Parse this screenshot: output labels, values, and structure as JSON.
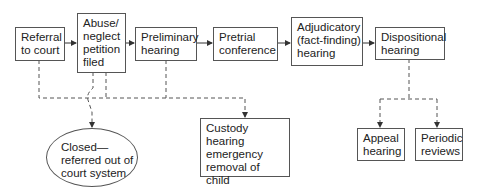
{
  "diagram": {
    "type": "flowchart",
    "main_flow": [
      {
        "id": "referral",
        "lines": [
          "Referral",
          "to court"
        ]
      },
      {
        "id": "petition",
        "lines": [
          "Abuse/",
          "neglect",
          "petition",
          "filed"
        ]
      },
      {
        "id": "preliminary",
        "lines": [
          "Preliminary",
          "hearing"
        ]
      },
      {
        "id": "pretrial",
        "lines": [
          "Pretrial",
          "conference"
        ]
      },
      {
        "id": "adjudicatory",
        "lines": [
          "Adjudicatory",
          "(fact-finding)",
          "hearing"
        ]
      },
      {
        "id": "dispositional",
        "lines": [
          "Dispositional",
          "hearing"
        ]
      }
    ],
    "branches": [
      {
        "id": "closed",
        "shape": "oval",
        "lines": [
          "Closed—",
          "referred out of",
          "court system"
        ],
        "from": [
          "referral",
          "petition"
        ]
      },
      {
        "id": "custody",
        "shape": "box",
        "lines": [
          "Custody hearing",
          "emergency",
          "removal of",
          "child"
        ],
        "from": [
          "referral",
          "petition",
          "preliminary"
        ]
      },
      {
        "id": "appeal",
        "shape": "box",
        "lines": [
          "Appeal",
          "hearing"
        ],
        "from": [
          "dispositional"
        ]
      },
      {
        "id": "periodic",
        "shape": "box",
        "lines": [
          "Periodic",
          "reviews"
        ],
        "from": [
          "dispositional"
        ]
      }
    ],
    "colors": {
      "stroke": "#555555",
      "text": "#222222",
      "background": "#ffffff"
    }
  }
}
